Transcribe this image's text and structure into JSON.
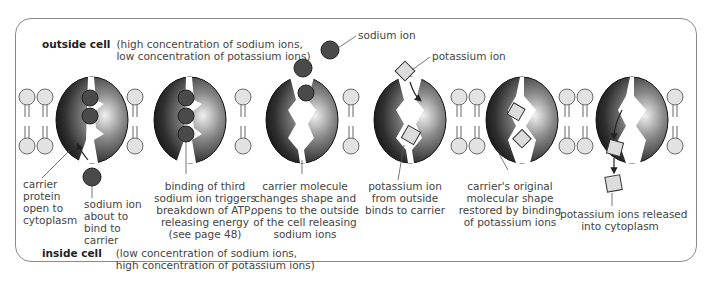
{
  "outside": {
    "title": "outside cell",
    "line1": "(high concentration of sodium ions,",
    "line2": "low concentration of potassium ions)"
  },
  "inside": {
    "title": "inside cell",
    "line1": "(low concentration of sodium ions,",
    "line2": "high concentration of potassium ions)"
  },
  "callouts": {
    "sodium_ion": "sodium ion",
    "potassium_ion": "potassium ion"
  },
  "steps": [
    {
      "lines": [
        "carrier",
        "protein",
        "open to",
        "cytoplasm"
      ]
    },
    {
      "lines": [
        "sodium ion",
        "about to",
        "bind to",
        "carrier"
      ]
    },
    {
      "lines": [
        "binding of third",
        "sodium ion triggers",
        "breakdown of ATP,",
        "releasing energy",
        "(see page 48)"
      ]
    },
    {
      "lines": [
        "carrier molecule",
        "changes shape and",
        "opens to the outside",
        "of the cell releasing",
        "sodium ions"
      ]
    },
    {
      "lines": [
        "potassium ion",
        "from outside",
        "binds to carrier"
      ]
    },
    {
      "lines": [
        "carrier's original",
        "molecular shape",
        "restored by binding",
        "of potassium ions"
      ]
    },
    {
      "lines": [
        "potassium ions released",
        "into cytoplasm"
      ]
    }
  ],
  "colors": {
    "frame": "#8a8a8a",
    "lipid_head": "#e2e2e2",
    "lipid_stroke": "#6a6a6a",
    "carrier_dark": "#1a1a1a",
    "carrier_light": "#d8d8d8",
    "sodium": "#4a4a4a",
    "potassium": "#dcdcdc"
  }
}
